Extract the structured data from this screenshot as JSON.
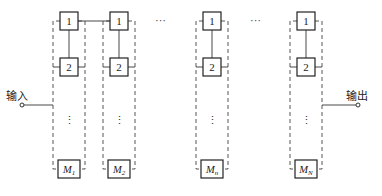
{
  "diagram": {
    "type": "parallel-series redundancy block diagram",
    "input_label": "输入",
    "output_label": "输出",
    "horizontal_ellipsis": "···",
    "vertical_ellipsis": "⋮",
    "columns": [
      {
        "id": "col-1",
        "blocks": [
          "1",
          "2"
        ],
        "last_block": {
          "base": "M",
          "sub": "1"
        }
      },
      {
        "id": "col-2",
        "blocks": [
          "1",
          "2"
        ],
        "last_block": {
          "base": "M",
          "sub": "2"
        }
      },
      {
        "id": "col-n",
        "blocks": [
          "1",
          "2"
        ],
        "last_block": {
          "base": "M",
          "sub": "n"
        }
      },
      {
        "id": "col-N",
        "blocks": [
          "1",
          "2"
        ],
        "last_block": {
          "base": "M",
          "sub": "N"
        }
      }
    ],
    "colors": {
      "line": "#333333",
      "box_border": "#222222",
      "background": "#ffffff"
    }
  }
}
